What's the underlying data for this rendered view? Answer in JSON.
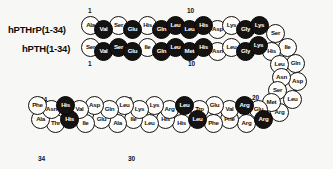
{
  "figure": {
    "type": "peptide-sequence-alignment-diagram",
    "width": 333,
    "height": 169,
    "background": "#f7f7f5",
    "bead_fill_light": "#fdfdfb",
    "bead_fill_dark": "#151311",
    "outline_color": "#15120f"
  },
  "labels": {
    "pthrp": "hPTHrP(1-34)",
    "pth": "hPTH(1-34)"
  },
  "number_tags": [
    {
      "id": "pthrp-1",
      "text": "1",
      "x": 88,
      "y": 7
    },
    {
      "id": "pthrp-10",
      "text": "10",
      "x": 187,
      "y": 7
    },
    {
      "id": "pth-1",
      "text": "1",
      "x": 88,
      "y": 60
    },
    {
      "id": "pth-10",
      "text": "10",
      "x": 188,
      "y": 60
    },
    {
      "id": "pthrp-20",
      "text": "20",
      "x": 268,
      "y": 94
    },
    {
      "id": "pth-20",
      "text": "20",
      "x": 252,
      "y": 94
    },
    {
      "id": "pthrp-34",
      "text": "34",
      "x": 40,
      "y": 96
    },
    {
      "id": "pthrp-30",
      "text": "30",
      "x": 125,
      "y": 96
    },
    {
      "id": "pth-34",
      "text": "34",
      "x": 38,
      "y": 155
    },
    {
      "id": "pth-30",
      "text": "30",
      "x": 128,
      "y": 155
    }
  ],
  "chains": [
    {
      "name": "hPTHrP(1-34)",
      "residues": [
        {
          "n": 1,
          "aa": "Ala",
          "filled": false,
          "x": 81,
          "y": 16
        },
        {
          "n": 2,
          "aa": "Val",
          "filled": true,
          "x": 94,
          "y": 20
        },
        {
          "n": 3,
          "aa": "Ser",
          "filled": false,
          "x": 109,
          "y": 16
        },
        {
          "n": 4,
          "aa": "Glu",
          "filled": true,
          "x": 123,
          "y": 20
        },
        {
          "n": 5,
          "aa": "His",
          "filled": false,
          "x": 138,
          "y": 16
        },
        {
          "n": 6,
          "aa": "Gln",
          "filled": true,
          "x": 152,
          "y": 20
        },
        {
          "n": 7,
          "aa": "Leu",
          "filled": true,
          "x": 166,
          "y": 16
        },
        {
          "n": 8,
          "aa": "Leu",
          "filled": true,
          "x": 180,
          "y": 20
        },
        {
          "n": 9,
          "aa": "His",
          "filled": true,
          "x": 194,
          "y": 16
        },
        {
          "n": 10,
          "aa": "Asp",
          "filled": false,
          "x": 208,
          "y": 20
        },
        {
          "n": 11,
          "aa": "Lys",
          "filled": false,
          "x": 222,
          "y": 16
        },
        {
          "n": 12,
          "aa": "Gly",
          "filled": true,
          "x": 236,
          "y": 20
        },
        {
          "n": 13,
          "aa": "Lys",
          "filled": true,
          "x": 250,
          "y": 16
        },
        {
          "n": 14,
          "aa": "Ser",
          "filled": false,
          "x": 266,
          "y": 24
        },
        {
          "n": 15,
          "aa": "Ile",
          "filled": false,
          "x": 278,
          "y": 38
        },
        {
          "n": 16,
          "aa": "Gln",
          "filled": false,
          "x": 286,
          "y": 54
        },
        {
          "n": 17,
          "aa": "Asp",
          "filled": false,
          "x": 288,
          "y": 72
        },
        {
          "n": 18,
          "aa": "Leu",
          "filled": false,
          "x": 283,
          "y": 90
        },
        {
          "n": 19,
          "aa": "Arg",
          "filled": false,
          "x": 270,
          "y": 103
        },
        {
          "n": 20,
          "aa": "Arg",
          "filled": true,
          "x": 254,
          "y": 110
        },
        {
          "n": 21,
          "aa": "Arg",
          "filled": false,
          "x": 237,
          "y": 114
        },
        {
          "n": 22,
          "aa": "Phe",
          "filled": false,
          "x": 220,
          "y": 110
        },
        {
          "n": 23,
          "aa": "Phe",
          "filled": false,
          "x": 204,
          "y": 114
        },
        {
          "n": 24,
          "aa": "Leu",
          "filled": true,
          "x": 188,
          "y": 110
        },
        {
          "n": 25,
          "aa": "His",
          "filled": false,
          "x": 172,
          "y": 114
        },
        {
          "n": 26,
          "aa": "His",
          "filled": false,
          "x": 156,
          "y": 110
        },
        {
          "n": 27,
          "aa": "Leu",
          "filled": false,
          "x": 140,
          "y": 114
        },
        {
          "n": 28,
          "aa": "Ile",
          "filled": false,
          "x": 124,
          "y": 110
        },
        {
          "n": 29,
          "aa": "Ala",
          "filled": false,
          "x": 108,
          "y": 114
        },
        {
          "n": 30,
          "aa": "Glu",
          "filled": false,
          "x": 92,
          "y": 110
        },
        {
          "n": 31,
          "aa": "Ile",
          "filled": false,
          "x": 76,
          "y": 114
        },
        {
          "n": 32,
          "aa": "His",
          "filled": true,
          "x": 60,
          "y": 110
        },
        {
          "n": 33,
          "aa": "Thr",
          "filled": false,
          "x": 46,
          "y": 114
        },
        {
          "n": 34,
          "aa": "Ala",
          "filled": false,
          "x": 31,
          "y": 110
        }
      ]
    },
    {
      "name": "hPTH(1-34)",
      "residues": [
        {
          "n": 1,
          "aa": "Ser",
          "filled": false,
          "x": 81,
          "y": 38
        },
        {
          "n": 2,
          "aa": "Val",
          "filled": true,
          "x": 94,
          "y": 42
        },
        {
          "n": 3,
          "aa": "Ser",
          "filled": true,
          "x": 109,
          "y": 38
        },
        {
          "n": 4,
          "aa": "Glu",
          "filled": true,
          "x": 123,
          "y": 42
        },
        {
          "n": 5,
          "aa": "Ile",
          "filled": false,
          "x": 138,
          "y": 38
        },
        {
          "n": 6,
          "aa": "Gln",
          "filled": true,
          "x": 152,
          "y": 42
        },
        {
          "n": 7,
          "aa": "Leu",
          "filled": true,
          "x": 166,
          "y": 38
        },
        {
          "n": 8,
          "aa": "Met",
          "filled": true,
          "x": 180,
          "y": 42
        },
        {
          "n": 9,
          "aa": "His",
          "filled": true,
          "x": 194,
          "y": 38
        },
        {
          "n": 10,
          "aa": "Asn",
          "filled": false,
          "x": 208,
          "y": 42
        },
        {
          "n": 11,
          "aa": "Leu",
          "filled": false,
          "x": 222,
          "y": 38
        },
        {
          "n": 12,
          "aa": "Gly",
          "filled": true,
          "x": 236,
          "y": 42
        },
        {
          "n": 13,
          "aa": "Lys",
          "filled": true,
          "x": 249,
          "y": 36
        },
        {
          "n": 14,
          "aa": "His",
          "filled": false,
          "x": 262,
          "y": 42
        },
        {
          "n": 15,
          "aa": "Leu",
          "filled": false,
          "x": 270,
          "y": 55
        },
        {
          "n": 16,
          "aa": "Asn",
          "filled": false,
          "x": 272,
          "y": 68
        },
        {
          "n": 17,
          "aa": "Ser",
          "filled": false,
          "x": 268,
          "y": 81
        },
        {
          "n": 18,
          "aa": "Met",
          "filled": false,
          "x": 262,
          "y": 93
        },
        {
          "n": 19,
          "aa": "Glu",
          "filled": false,
          "x": 249,
          "y": 100
        },
        {
          "n": 20,
          "aa": "Arg",
          "filled": true,
          "x": 235,
          "y": 96
        },
        {
          "n": 21,
          "aa": "Val",
          "filled": false,
          "x": 220,
          "y": 100
        },
        {
          "n": 22,
          "aa": "Glu",
          "filled": false,
          "x": 205,
          "y": 96
        },
        {
          "n": 23,
          "aa": "Trp",
          "filled": false,
          "x": 190,
          "y": 100
        },
        {
          "n": 24,
          "aa": "Leu",
          "filled": true,
          "x": 175,
          "y": 96
        },
        {
          "n": 25,
          "aa": "Arg",
          "filled": false,
          "x": 160,
          "y": 100
        },
        {
          "n": 26,
          "aa": "Lys",
          "filled": false,
          "x": 145,
          "y": 96
        },
        {
          "n": 27,
          "aa": "Lys",
          "filled": false,
          "x": 130,
          "y": 100
        },
        {
          "n": 28,
          "aa": "Leu",
          "filled": false,
          "x": 115,
          "y": 96
        },
        {
          "n": 29,
          "aa": "Gln",
          "filled": false,
          "x": 100,
          "y": 100
        },
        {
          "n": 30,
          "aa": "Asp",
          "filled": false,
          "x": 85,
          "y": 96
        },
        {
          "n": 31,
          "aa": "Val",
          "filled": false,
          "x": 70,
          "y": 100
        },
        {
          "n": 32,
          "aa": "His",
          "filled": true,
          "x": 56,
          "y": 96
        },
        {
          "n": 33,
          "aa": "Asn",
          "filled": false,
          "x": 42,
          "y": 100
        },
        {
          "n": 34,
          "aa": "Phe",
          "filled": false,
          "x": 28,
          "y": 96
        }
      ]
    }
  ]
}
